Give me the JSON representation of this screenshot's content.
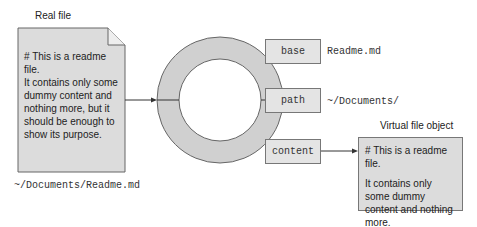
{
  "real_file": {
    "title": "Real file",
    "heading": "# This is a readme file.",
    "body": "It contains only some dummy content and nothing more, but it should be enough to show its purpose.",
    "path": "~/Documents/Readme.md"
  },
  "properties": [
    {
      "name": "base",
      "value": "Readme.md"
    },
    {
      "name": "path",
      "value": "~/Documents/"
    },
    {
      "name": "content",
      "value": ""
    }
  ],
  "virtual_file": {
    "title": "Virtual file object",
    "heading": "# This is a readme file.",
    "body": "It contains only some dummy content and nothing more."
  },
  "colors": {
    "box_fill": "#dcdcdc",
    "ring_fill": "#d0d0d0",
    "stroke": "#666666"
  }
}
